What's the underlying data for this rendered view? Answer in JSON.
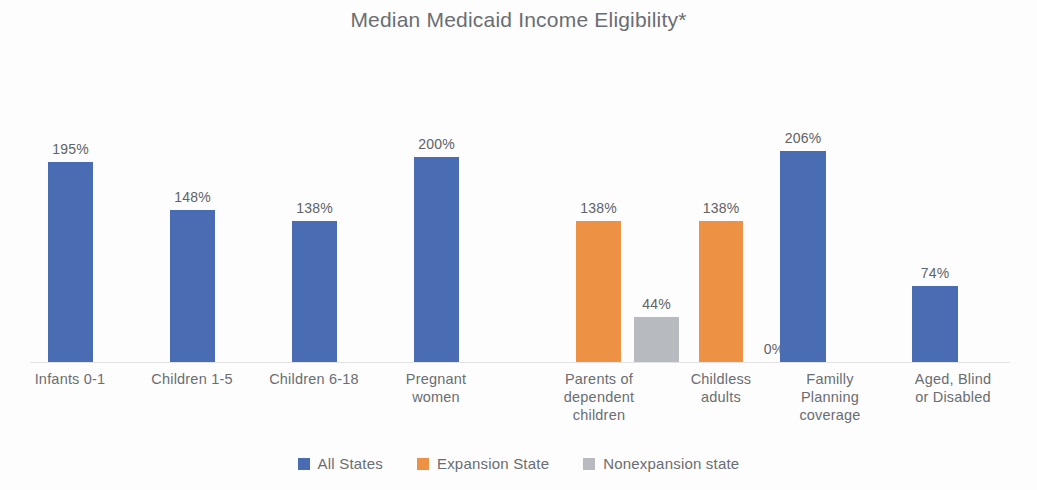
{
  "chart_data": {
    "type": "bar",
    "title": "Median Medicaid Income Eligibility*",
    "xlabel": "",
    "ylabel": "",
    "ylim": [
      0,
      206
    ],
    "grid": false,
    "legend_position": "bottom",
    "categories": [
      "Infants 0-1",
      "Children 1-5",
      "Children 6-18",
      "Pregnant women",
      "Parents of dependent children",
      "Childless adults",
      "Familly Planning coverage",
      "Aged, Blind or Disabled"
    ],
    "category_lines": [
      [
        "Infants 0-1"
      ],
      [
        "Children 1-5"
      ],
      [
        "Children 6-18"
      ],
      [
        "Pregnant",
        "women"
      ],
      [
        "Parents of",
        "dependent",
        "children"
      ],
      [
        "Childless",
        "adults"
      ],
      [
        "Familly",
        "Planning",
        "coverage"
      ],
      [
        "Aged, Blind",
        "or Disabled"
      ]
    ],
    "series": [
      {
        "name": "All States",
        "color": "#4a6cb3",
        "values": [
          195,
          148,
          138,
          200,
          null,
          null,
          206,
          74
        ],
        "labels": [
          "195%",
          "148%",
          "138%",
          "200%",
          "",
          "",
          "206%",
          "74%"
        ]
      },
      {
        "name": "Expansion State",
        "color": "#ed9144",
        "values": [
          null,
          null,
          null,
          null,
          138,
          138,
          null,
          null
        ],
        "labels": [
          "",
          "",
          "",
          "",
          "138%",
          "138%",
          "",
          ""
        ]
      },
      {
        "name": "Nonexpansion state",
        "color": "#b7babe",
        "values": [
          null,
          null,
          null,
          null,
          44,
          0,
          null,
          null
        ],
        "labels": [
          "",
          "",
          "",
          "",
          "44%",
          "0%",
          "",
          ""
        ]
      }
    ],
    "bars": [
      {
        "name": "infants-all-states",
        "series": "All States",
        "category": "Infants 0-1",
        "value": 195,
        "label": "195%",
        "color": "blue",
        "x": 48,
        "w": 45
      },
      {
        "name": "children-1-5-all-states",
        "series": "All States",
        "category": "Children 1-5",
        "value": 148,
        "label": "148%",
        "color": "blue",
        "x": 170,
        "w": 45
      },
      {
        "name": "children-6-18-all-states",
        "series": "All States",
        "category": "Children 6-18",
        "value": 138,
        "label": "138%",
        "color": "blue",
        "x": 292,
        "w": 45
      },
      {
        "name": "pregnant-all-states",
        "series": "All States",
        "category": "Pregnant women",
        "value": 200,
        "label": "200%",
        "color": "blue",
        "x": 414,
        "w": 45
      },
      {
        "name": "parents-expansion",
        "series": "Expansion State",
        "category": "Parents of dependent children",
        "value": 138,
        "label": "138%",
        "color": "orange",
        "x": 576,
        "w": 45
      },
      {
        "name": "parents-nonexpansion",
        "series": "Nonexpansion state",
        "category": "Parents of dependent children",
        "value": 44,
        "label": "44%",
        "color": "gray",
        "x": 634,
        "w": 45
      },
      {
        "name": "childless-expansion",
        "series": "Expansion State",
        "category": "Childless adults",
        "value": 138,
        "label": "138%",
        "color": "orange",
        "x": 699,
        "w": 44
      },
      {
        "name": "childless-nonexpansion",
        "series": "Nonexpansion state",
        "category": "Childless adults",
        "value": 0,
        "label": "0%",
        "color": "gray",
        "x": 752,
        "w": 44
      },
      {
        "name": "family-planning-all-states",
        "series": "All States",
        "category": "Familly Planning coverage",
        "value": 206,
        "label": "206%",
        "color": "blue",
        "x": 780,
        "w": 46
      },
      {
        "name": "aged-blind-all-states",
        "series": "All States",
        "category": "Aged, Blind or Disabled",
        "value": 74,
        "label": "74%",
        "color": "blue",
        "x": 912,
        "w": 46
      }
    ],
    "legend": [
      {
        "label": "All States",
        "color": "#4a6cb3"
      },
      {
        "label": "Expansion State",
        "color": "#ed9144"
      },
      {
        "label": "Nonexpansion state",
        "color": "#b7babe"
      }
    ]
  }
}
